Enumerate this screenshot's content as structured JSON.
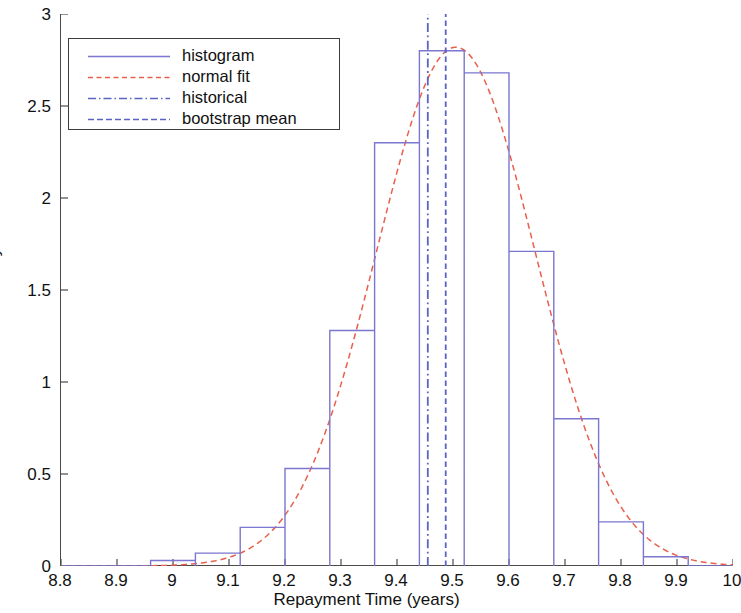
{
  "chart_data": {
    "type": "bar",
    "title": "",
    "subtitle": "",
    "xlabel": "Repayment Time (years)",
    "ylabel": "Density",
    "xlim": [
      8.8,
      10
    ],
    "ylim": [
      0,
      3
    ],
    "grid": false,
    "legend_position": "upper-left",
    "xticks": [
      "8.8",
      "8.9",
      "9",
      "9.1",
      "9.2",
      "9.3",
      "9.4",
      "9.5",
      "9.6",
      "9.7",
      "9.8",
      "9.9",
      "10"
    ],
    "xtick_values": [
      8.8,
      8.9,
      9.0,
      9.1,
      9.2,
      9.3,
      9.4,
      9.5,
      9.6,
      9.7,
      9.8,
      9.9,
      10.0
    ],
    "yticks": [
      "0",
      "0.5",
      "1",
      "1.5",
      "2",
      "2.5",
      "3"
    ],
    "ytick_values": [
      0,
      0.5,
      1.0,
      1.5,
      2.0,
      2.5,
      3.0
    ],
    "series": [
      {
        "name": "histogram",
        "type": "bar",
        "color": "#7b76cf",
        "bin_width": 0.08,
        "bin_edges": [
          8.96,
          9.04,
          9.12,
          9.2,
          9.28,
          9.36,
          9.44,
          9.52,
          9.6,
          9.68,
          9.76,
          9.84,
          9.92
        ],
        "bin_centers": [
          9.0,
          9.08,
          9.16,
          9.24,
          9.32,
          9.4,
          9.48,
          9.56,
          9.64,
          9.72,
          9.8,
          9.88
        ],
        "values": [
          0.03,
          0.07,
          0.21,
          0.53,
          1.28,
          2.3,
          2.8,
          2.68,
          1.71,
          0.8,
          0.24,
          0.05
        ]
      },
      {
        "name": "normal fit",
        "type": "line",
        "color": "#e8604c",
        "style": "dashed",
        "mu": 9.505,
        "sigma": 0.1415,
        "peak_density": 2.82
      },
      {
        "name": "historical",
        "type": "vline",
        "color": "#5b63c4",
        "style": "dash-dot",
        "x": 9.455
      },
      {
        "name": "bootstrap mean",
        "type": "vline",
        "color": "#5b63c4",
        "style": "dashed",
        "x": 9.487
      }
    ]
  },
  "legend": {
    "entries": [
      {
        "label": "histogram"
      },
      {
        "label": "normal fit"
      },
      {
        "label": "historical"
      },
      {
        "label": "bootstrap mean"
      }
    ]
  },
  "colors": {
    "histogram": "#7b76cf",
    "normal_fit": "#e8604c",
    "historical": "#5b63c4",
    "bootstrap_mean": "#5b63c4",
    "axis": "#4a4a4a",
    "background": "#ffffff"
  }
}
